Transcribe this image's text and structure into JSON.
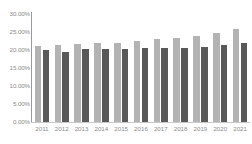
{
  "chart_data": {
    "type": "bar",
    "title": "",
    "subtitle": "",
    "xlabel": "",
    "ylabel": "",
    "categories": [
      "2011",
      "2012",
      "2013",
      "2014",
      "2015",
      "2016",
      "2017",
      "2018",
      "2019",
      "2020",
      "2021"
    ],
    "series": [
      {
        "name": "series-light",
        "color": "#b3b3b3",
        "values": [
          21.2,
          21.4,
          21.6,
          22.0,
          21.9,
          22.5,
          23.0,
          23.3,
          23.8,
          24.7,
          25.8
        ]
      },
      {
        "name": "series-dark",
        "color": "#595959",
        "values": [
          20.1,
          19.5,
          20.2,
          20.3,
          20.4,
          20.5,
          20.5,
          20.5,
          20.7,
          21.5,
          21.9
        ]
      }
    ],
    "ylim": [
      0,
      30
    ],
    "ytick_values": [
      0,
      5,
      10,
      15,
      20,
      25,
      30
    ],
    "ytick_labels": [
      "0.00%",
      "5.00%",
      "10.00%",
      "15.00%",
      "20.00%",
      "25.00%",
      "30.00%"
    ],
    "grid": false,
    "legend": "none",
    "axis_label_color": "#8a8a8a",
    "axis_line_color": "#9a9a9a",
    "background_color": "#ffffff"
  }
}
